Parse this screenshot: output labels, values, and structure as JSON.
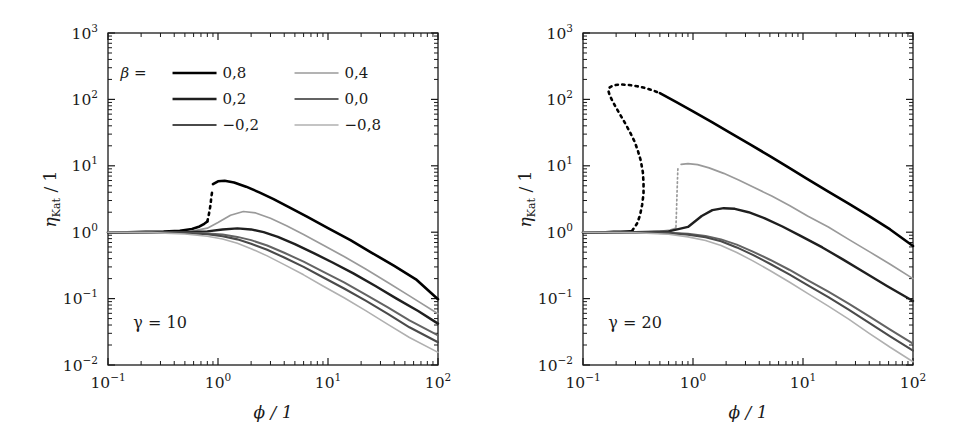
{
  "figure": {
    "background": "#ffffff",
    "panel_count": 2
  },
  "axes": {
    "xlabel": "ϕ / 1",
    "ylabel": "ηKat / 1",
    "ylabel_main": "η",
    "ylabel_sub": "Kat",
    "ylabel_tail": " / 1",
    "xscale": "log",
    "yscale": "log",
    "xlim": [
      0.1,
      100
    ],
    "ylim": [
      0.01,
      1000
    ],
    "xticks": [
      {
        "value": 0.1,
        "mantissa": "10",
        "exponent": "−1"
      },
      {
        "value": 1,
        "mantissa": "10",
        "exponent": "0"
      },
      {
        "value": 10,
        "mantissa": "10",
        "exponent": "1"
      },
      {
        "value": 100,
        "mantissa": "10",
        "exponent": "2"
      }
    ],
    "yticks": [
      {
        "value": 0.01,
        "mantissa": "10",
        "exponent": "−2"
      },
      {
        "value": 0.1,
        "mantissa": "10",
        "exponent": "−1"
      },
      {
        "value": 1,
        "mantissa": "10",
        "exponent": "0"
      },
      {
        "value": 10,
        "mantissa": "10",
        "exponent": "1"
      },
      {
        "value": 100,
        "mantissa": "10",
        "exponent": "2"
      },
      {
        "value": 1000,
        "mantissa": "10",
        "exponent": "3"
      }
    ],
    "grid": false,
    "minor_ticks": true,
    "tick_direction": "in"
  },
  "legend": {
    "title": "β =",
    "position": "upper-left-inside-left-panel",
    "columns": 2,
    "entries": [
      {
        "label": "0,8",
        "value": 0.8,
        "color": "#000000",
        "width": 2.6
      },
      {
        "label": "0,4",
        "value": 0.4,
        "color": "#9a9a9a",
        "width": 1.7
      },
      {
        "label": "0,2",
        "value": 0.2,
        "color": "#1f1f1f",
        "width": 2.4
      },
      {
        "label": "0,0",
        "value": 0.0,
        "color": "#636363",
        "width": 2.0
      },
      {
        "label": "−0,2",
        "value": -0.2,
        "color": "#4a4a4a",
        "width": 2.1
      },
      {
        "label": "−0,8",
        "value": -0.8,
        "color": "#b0b0b0",
        "width": 1.6
      }
    ]
  },
  "panels": [
    {
      "id": "panel-gamma-10",
      "annotation": "γ = 10",
      "gamma": 10,
      "has_legend": true
    },
    {
      "id": "panel-gamma-20",
      "annotation": "γ = 20",
      "gamma": 20,
      "has_legend": false
    }
  ],
  "chart_data": [
    {
      "type": "line",
      "title": "",
      "subtitle": "γ = 10",
      "xlabel": "ϕ / 1",
      "ylabel": "ηKat / 1",
      "xscale": "log",
      "yscale": "log",
      "xlim": [
        0.1,
        100
      ],
      "ylim": [
        0.01,
        1000
      ],
      "grid": false,
      "legend_position": "upper left",
      "series": [
        {
          "name": "0,8",
          "beta": 0.8,
          "color": "#000000",
          "linewidth": 2.6,
          "solid_lower": {
            "x": [
              0.1,
              0.15,
              0.22,
              0.32,
              0.45,
              0.58,
              0.68,
              0.75,
              0.8
            ],
            "y": [
              1.0,
              1.0,
              1.01,
              1.02,
              1.05,
              1.12,
              1.22,
              1.34,
              1.45
            ]
          },
          "dotted": {
            "x": [
              0.8,
              0.82,
              0.84,
              0.855,
              0.865,
              0.875,
              0.885
            ],
            "y": [
              1.45,
              1.75,
              2.15,
              2.6,
              3.1,
              3.6,
              4.1
            ]
          },
          "solid_upper": {
            "x": [
              0.9,
              1.0,
              1.15,
              1.4,
              1.8,
              2.4,
              3.2,
              4.5,
              6.5,
              10,
              16,
              25,
              40,
              63,
              100
            ],
            "y": [
              5.3,
              5.85,
              5.95,
              5.6,
              4.85,
              3.95,
              3.15,
              2.35,
              1.7,
              1.15,
              0.76,
              0.49,
              0.31,
              0.195,
              0.098
            ]
          }
        },
        {
          "name": "0,4",
          "beta": 0.4,
          "color": "#9a9a9a",
          "linewidth": 1.7,
          "x": [
            0.1,
            0.2,
            0.35,
            0.55,
            0.8,
            1.0,
            1.3,
            1.7,
            2.2,
            3.0,
            4.2,
            6.0,
            9.0,
            14,
            22,
            35,
            55,
            100
          ],
          "y": [
            1.0,
            1.0,
            1.0,
            1.02,
            1.15,
            1.4,
            1.8,
            2.05,
            1.95,
            1.62,
            1.25,
            0.92,
            0.64,
            0.43,
            0.28,
            0.175,
            0.11,
            0.059
          ]
        },
        {
          "name": "0,2",
          "beta": 0.2,
          "color": "#1f1f1f",
          "linewidth": 2.4,
          "x": [
            0.1,
            0.25,
            0.5,
            0.8,
            1.1,
            1.5,
            2.0,
            2.6,
            3.5,
            5.0,
            7.5,
            11,
            17,
            27,
            42,
            66,
            100
          ],
          "y": [
            1.0,
            1.0,
            1.0,
            1.03,
            1.1,
            1.14,
            1.1,
            1.0,
            0.85,
            0.66,
            0.48,
            0.35,
            0.24,
            0.155,
            0.1,
            0.065,
            0.042
          ]
        },
        {
          "name": "0,0",
          "beta": 0.0,
          "color": "#636363",
          "linewidth": 2.0,
          "x": [
            0.1,
            0.25,
            0.5,
            0.8,
            1.1,
            1.5,
            2.0,
            2.8,
            4.0,
            6.0,
            9.0,
            14,
            22,
            35,
            55,
            100
          ],
          "y": [
            1.0,
            1.0,
            0.99,
            0.96,
            0.92,
            0.85,
            0.76,
            0.63,
            0.49,
            0.36,
            0.255,
            0.175,
            0.115,
            0.074,
            0.047,
            0.028
          ]
        },
        {
          "name": "−0,2",
          "beta": -0.2,
          "color": "#4a4a4a",
          "linewidth": 2.1,
          "x": [
            0.1,
            0.25,
            0.5,
            0.8,
            1.1,
            1.5,
            2.0,
            2.8,
            4.0,
            6.0,
            9.0,
            14,
            22,
            35,
            55,
            100
          ],
          "y": [
            1.0,
            0.995,
            0.975,
            0.93,
            0.87,
            0.78,
            0.67,
            0.545,
            0.415,
            0.3,
            0.21,
            0.142,
            0.093,
            0.059,
            0.037,
            0.022
          ]
        },
        {
          "name": "−0,8",
          "beta": -0.8,
          "color": "#b0b0b0",
          "linewidth": 1.6,
          "x": [
            0.1,
            0.25,
            0.5,
            0.8,
            1.1,
            1.5,
            2.0,
            2.8,
            4.0,
            6.0,
            9.0,
            14,
            22,
            35,
            55,
            100
          ],
          "y": [
            1.0,
            0.985,
            0.94,
            0.87,
            0.79,
            0.68,
            0.565,
            0.44,
            0.325,
            0.228,
            0.155,
            0.103,
            0.066,
            0.041,
            0.026,
            0.0155
          ]
        }
      ]
    },
    {
      "type": "line",
      "title": "",
      "subtitle": "γ = 20",
      "xlabel": "ϕ / 1",
      "ylabel": "ηKat / 1",
      "xscale": "log",
      "yscale": "log",
      "xlim": [
        0.1,
        100
      ],
      "ylim": [
        0.01,
        1000
      ],
      "grid": false,
      "legend_position": "none",
      "series": [
        {
          "name": "0,8",
          "beta": 0.8,
          "color": "#000000",
          "linewidth": 2.6,
          "solid_lower": {
            "x": [
              0.1,
              0.13,
              0.16,
              0.19,
              0.22,
              0.25,
              0.28
            ],
            "y": [
              1.0,
              1.0,
              1.0,
              1.01,
              1.01,
              1.02,
              1.03
            ]
          },
          "dotted_loop": {
            "x": [
              0.28,
              0.31,
              0.33,
              0.345,
              0.355,
              0.355,
              0.35,
              0.335,
              0.315,
              0.295,
              0.27,
              0.245,
              0.22,
              0.2,
              0.185,
              0.175,
              0.17,
              0.175,
              0.19,
              0.22,
              0.26,
              0.31,
              0.37,
              0.44,
              0.5
            ],
            "y": [
              1.05,
              1.35,
              1.8,
              2.6,
              3.8,
              5.5,
              8.0,
              12,
              17,
              23,
              31,
              42,
              57,
              75,
              95,
              115,
              135,
              152,
              163,
              168,
              165,
              158,
              148,
              135,
              124
            ]
          },
          "solid_upper": {
            "x": [
              0.5,
              0.7,
              1.0,
              1.5,
              2.2,
              3.3,
              5.0,
              7.5,
              11,
              17,
              26,
              40,
              62,
              100
            ],
            "y": [
              124,
              92,
              66,
              45,
              31,
              21,
              14,
              9.3,
              6.3,
              4.1,
              2.7,
              1.75,
              1.1,
              0.62
            ]
          }
        },
        {
          "name": "0,4",
          "beta": 0.4,
          "color": "#9a9a9a",
          "linewidth": 1.7,
          "solid_lower": {
            "x": [
              0.1,
              0.2,
              0.35,
              0.5,
              0.62,
              0.7
            ],
            "y": [
              1.0,
              1.0,
              1.0,
              1.03,
              1.08,
              1.15
            ]
          },
          "dotted": {
            "x": [
              0.7,
              0.705,
              0.71,
              0.715,
              0.72,
              0.725,
              0.73
            ],
            "y": [
              1.2,
              1.7,
              2.5,
              3.6,
              5.2,
              7.3,
              9.5
            ]
          },
          "solid_upper": {
            "x": [
              0.78,
              0.9,
              1.1,
              1.4,
              1.9,
              2.6,
              3.6,
              5.2,
              7.6,
              11,
              17,
              26,
              40,
              62,
              100
            ],
            "y": [
              10.5,
              10.8,
              10.4,
              9.3,
              7.7,
              6.1,
              4.7,
              3.5,
              2.5,
              1.75,
              1.2,
              0.78,
              0.51,
              0.33,
              0.2
            ]
          }
        },
        {
          "name": "0,2",
          "beta": 0.2,
          "color": "#1f1f1f",
          "linewidth": 2.4,
          "x": [
            0.1,
            0.3,
            0.6,
            0.9,
            1.2,
            1.5,
            1.9,
            2.4,
            3.2,
            4.5,
            6.5,
            9.5,
            15,
            23,
            36,
            58,
            100
          ],
          "y": [
            1.0,
            1.0,
            1.03,
            1.2,
            1.75,
            2.15,
            2.3,
            2.25,
            2.0,
            1.62,
            1.22,
            0.88,
            0.59,
            0.39,
            0.25,
            0.155,
            0.092
          ]
        },
        {
          "name": "0,0",
          "beta": 0.0,
          "color": "#636363",
          "linewidth": 2.0,
          "x": [
            0.1,
            0.3,
            0.6,
            0.9,
            1.3,
            1.8,
            2.5,
            3.5,
            5.0,
            7.5,
            11,
            17,
            26,
            40,
            62,
            100
          ],
          "y": [
            1.0,
            1.0,
            0.985,
            0.95,
            0.88,
            0.78,
            0.65,
            0.51,
            0.385,
            0.272,
            0.19,
            0.127,
            0.084,
            0.054,
            0.034,
            0.021
          ]
        },
        {
          "name": "−0,2",
          "beta": -0.2,
          "color": "#4a4a4a",
          "linewidth": 2.1,
          "x": [
            0.1,
            0.3,
            0.6,
            0.9,
            1.3,
            1.8,
            2.5,
            3.5,
            5.0,
            7.5,
            11,
            17,
            26,
            40,
            62,
            100
          ],
          "y": [
            1.0,
            0.995,
            0.97,
            0.92,
            0.84,
            0.73,
            0.59,
            0.455,
            0.335,
            0.232,
            0.16,
            0.105,
            0.068,
            0.043,
            0.027,
            0.0165
          ]
        },
        {
          "name": "−0,8",
          "beta": -0.8,
          "color": "#b0b0b0",
          "linewidth": 1.6,
          "x": [
            0.1,
            0.3,
            0.6,
            0.9,
            1.3,
            1.8,
            2.5,
            3.5,
            5.0,
            7.5,
            11,
            17,
            26,
            40,
            62,
            100
          ],
          "y": [
            1.0,
            0.98,
            0.93,
            0.85,
            0.75,
            0.63,
            0.495,
            0.37,
            0.265,
            0.178,
            0.12,
            0.077,
            0.049,
            0.03,
            0.0185,
            0.0112
          ]
        }
      ]
    }
  ]
}
